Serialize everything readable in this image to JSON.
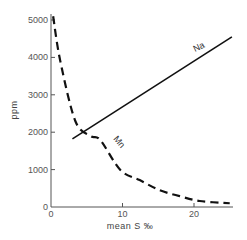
{
  "chart_data": {
    "type": "line",
    "title": "",
    "xlabel": "mean S ‰",
    "ylabel": "ppm",
    "xlim": [
      0,
      25
    ],
    "ylim": [
      0,
      5200
    ],
    "x_ticks": [
      0,
      10,
      20
    ],
    "y_ticks": [
      0,
      1000,
      2000,
      3000,
      4000,
      5000
    ],
    "x_tick_labels": [
      "0",
      "10",
      "20"
    ],
    "y_tick_labels": [
      "0",
      "1000",
      "2000",
      "3000",
      "4000",
      "5000"
    ],
    "grid": false,
    "legend": "inline labels",
    "series": [
      {
        "name": "Na",
        "style": "solid",
        "x": [
          3,
          25.3
        ],
        "y": [
          1820,
          4550
        ]
      },
      {
        "name": "Mn",
        "style": "dashed",
        "x": [
          0.3,
          1.3,
          3.4,
          5.5,
          6.9,
          9.7,
          12.4,
          15.2,
          18,
          20.8,
          25
        ],
        "y": [
          5100,
          3900,
          2300,
          1900,
          1790,
          990,
          720,
          450,
          290,
          160,
          100
        ]
      }
    ]
  }
}
